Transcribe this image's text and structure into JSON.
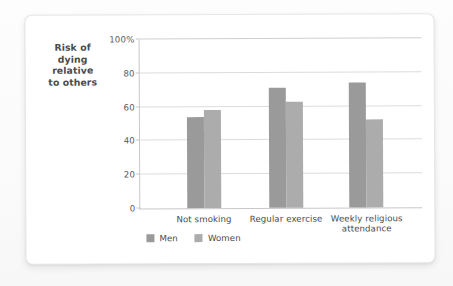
{
  "card": {
    "background_color": "#ffffff",
    "border_color": "#e6e6e6"
  },
  "legend": {
    "position": "bottom-left",
    "items": [
      {
        "label": "Men",
        "color": "#9a9a9a",
        "swatch_name": "legend-swatch-men"
      },
      {
        "label": "Women",
        "color": "#acacac",
        "swatch_name": "legend-swatch-women"
      }
    ]
  },
  "chart_data": {
    "type": "bar",
    "title": "",
    "subtitle": "",
    "xlabel": "",
    "ylabel": "Risk of dying relative to others",
    "ylabel_lines": [
      "Risk of",
      "dying",
      "relative",
      "to others"
    ],
    "categories": [
      "Not smoking",
      "Regular exercise",
      "Weekly religious attendance"
    ],
    "category_label_lines": [
      [
        "Not smoking"
      ],
      [
        "Regular exercise"
      ],
      [
        "Weekly religious",
        "attendance"
      ]
    ],
    "series": [
      {
        "name": "Men",
        "color": "#9a9a9a",
        "values": [
          54,
          71,
          74
        ]
      },
      {
        "name": "Women",
        "color": "#acacac",
        "values": [
          58,
          63,
          52
        ]
      }
    ],
    "ylim": [
      0,
      100
    ],
    "yticks": [
      0,
      20,
      40,
      60,
      80,
      100
    ],
    "ytick_labels": [
      "0",
      "20",
      "40",
      "60",
      "80",
      "100%"
    ],
    "grid": true,
    "grid_color": "#dcdcdc",
    "axis_color": "#c8c8c8",
    "legend_position": "bottom-left"
  }
}
